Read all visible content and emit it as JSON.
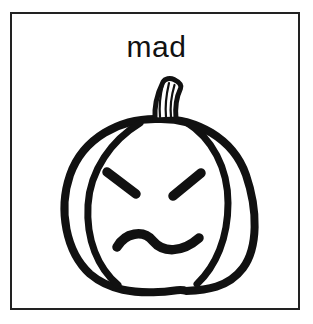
{
  "card": {
    "title": "mad",
    "illustration": "pumpkin-with-angry-face",
    "colors": {
      "line": "#111111",
      "border": "#222222",
      "background": "#ffffff"
    }
  }
}
